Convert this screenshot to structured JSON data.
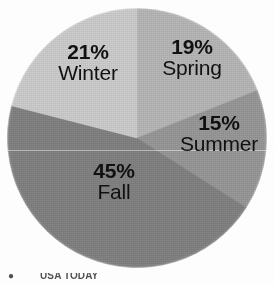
{
  "figure": {
    "kind": "pie-chart",
    "background_color": "#fdfdfd",
    "label_color": "#111111"
  },
  "footer": {
    "bullet": "●",
    "credit": "USA TODAY"
  },
  "chart_data": {
    "type": "pie",
    "title": "",
    "subtitle": "",
    "xlabel": "",
    "ylabel": "",
    "grid": false,
    "legend": "none",
    "label_position": "inside-slice",
    "value_unit": "%",
    "start_angle_deg": 0,
    "direction": "clockwise",
    "categories": [
      "Spring",
      "Summer",
      "Fall",
      "Winter"
    ],
    "values": [
      19,
      15,
      45,
      21
    ],
    "colors": [
      "#b9b9b9",
      "#9a9a9a",
      "#848484",
      "#cfcfcf"
    ],
    "slices": [
      {
        "name": "Spring",
        "value": 19,
        "percent_label": "19%",
        "color": "#b9b9b9",
        "start_angle_deg": 0,
        "end_angle_deg": 68.4
      },
      {
        "name": "Summer",
        "value": 15,
        "percent_label": "15%",
        "color": "#9a9a9a",
        "start_angle_deg": 68.4,
        "end_angle_deg": 122.4
      },
      {
        "name": "Fall",
        "value": 45,
        "percent_label": "45%",
        "color": "#848484",
        "start_angle_deg": 122.4,
        "end_angle_deg": 284.4
      },
      {
        "name": "Winter",
        "value": 21,
        "percent_label": "21%",
        "color": "#cfcfcf",
        "start_angle_deg": 284.4,
        "end_angle_deg": 360
      }
    ],
    "total": 100
  }
}
